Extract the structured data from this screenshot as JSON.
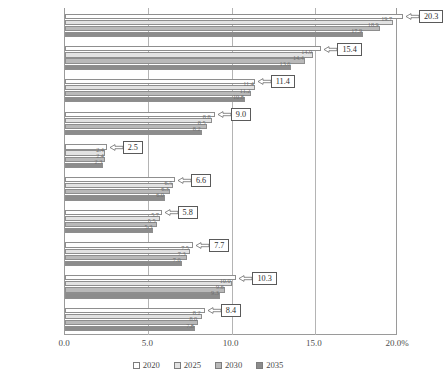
{
  "chart_data": {
    "type": "bar",
    "orientation": "horizontal",
    "title": "",
    "xlabel": "",
    "ylabel": "",
    "xlim": [
      0.0,
      20.0
    ],
    "xticks": [
      "0.0",
      "5.0",
      "10.0",
      "15.0",
      "20.0%"
    ],
    "xtick_values": [
      0.0,
      5.0,
      10.0,
      15.0,
      20.0
    ],
    "grid": true,
    "legend_position": "bottom",
    "categories": [
      "北海道",
      "東北",
      "関東",
      "甲信越",
      "北陸",
      "東海",
      "近畿",
      "中国",
      "四国",
      "九州・沖縄"
    ],
    "series": [
      {
        "name": "2020",
        "values": [
          20.3,
          15.4,
          11.4,
          9.0,
          2.5,
          6.6,
          5.8,
          7.7,
          10.3,
          8.4
        ]
      },
      {
        "name": "2025",
        "values": [
          19.7,
          14.9,
          11.4,
          8.8,
          2.4,
          6.5,
          5.7,
          7.5,
          10.0,
          8.2
        ]
      },
      {
        "name": "2030",
        "values": [
          18.9,
          14.4,
          11.2,
          8.5,
          2.4,
          6.3,
          5.5,
          7.3,
          9.6,
          8.0
        ]
      },
      {
        "name": "2035",
        "values": [
          17.9,
          13.6,
          10.8,
          8.2,
          2.3,
          6.0,
          5.3,
          7.0,
          9.3,
          7.8
        ]
      }
    ],
    "callout_labels": [
      "20.3",
      "15.4",
      "11.4",
      "9.0",
      "2.5",
      "6.6",
      "5.8",
      "7.7",
      "10.3",
      "8.4"
    ],
    "inline_labels": [
      [
        "19.7",
        "18.9",
        "17.9"
      ],
      [
        "14.9",
        "14.4",
        "13.6"
      ],
      [
        "11.4",
        "11.2",
        "10.8"
      ],
      [
        "8.8",
        "8.5",
        "8.2"
      ],
      [
        "2.4",
        "2.4",
        "2.3"
      ],
      [
        "6.5",
        "6.3",
        "6.0"
      ],
      [
        "5.7",
        "5.5",
        "5.3"
      ],
      [
        "7.5",
        "7.3",
        "7.0"
      ],
      [
        "10.0",
        "9.6",
        "9.3"
      ],
      [
        "8.2",
        "8.0",
        "7.8"
      ]
    ]
  },
  "legend": {
    "items": [
      {
        "label": "2020"
      },
      {
        "label": "2025"
      },
      {
        "label": "2030"
      },
      {
        "label": "2035"
      }
    ]
  },
  "caption": ""
}
